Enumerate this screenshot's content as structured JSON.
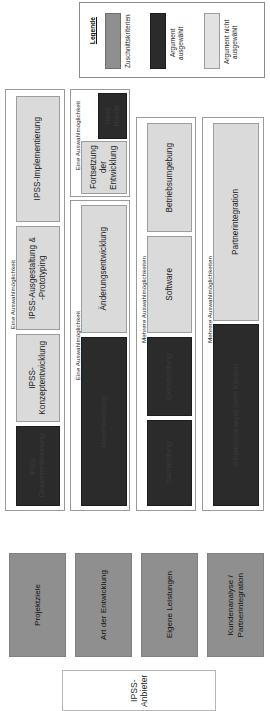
{
  "diagram": {
    "root": {
      "label": "IPSS- Anbieter"
    },
    "legend": {
      "title": "Legende",
      "items": [
        {
          "label": "Zuschnittskriterien",
          "color": "#8f8f8f",
          "swatch": "criterion"
        },
        {
          "label": "Argument\nausgewählt",
          "color": "#2b2b2b",
          "swatch": "selected"
        },
        {
          "label": "Argument nicht\nausgewählt",
          "color": "#dadada",
          "swatch": "unselected"
        }
      ]
    },
    "columns": [
      {
        "criterion": "Projektziele",
        "group_label": "Eine Auswahlmöglichkeit",
        "nodes": [
          {
            "label": "IPSS-Implementierung",
            "state": "unselected"
          },
          {
            "label": "IPSS-Ausgestaltung &\n-Prototyping",
            "state": "unselected"
          },
          {
            "label": "IPSS-\nKonzeptentwicklung",
            "state": "unselected"
          },
          {
            "label": "IPSS-\nGesamtentwicklung",
            "state": "selected"
          }
        ]
      },
      {
        "criterion": "Art der Entwicklung",
        "group_label": "Eine Auswahlmöglichkeit",
        "subgroup_label": "Eine Auswahlmöglichkeit",
        "nodes": [
          {
            "label": "Neue\nRunde",
            "state": "selected"
          },
          {
            "label": "Fortsetzung der\nEntwicklung",
            "state": "unselected"
          },
          {
            "label": "Änderungsentwicklung",
            "state": "unselected"
          },
          {
            "label": "Neuentwicklung",
            "state": "selected"
          }
        ]
      },
      {
        "criterion": "Eigene Leistungen",
        "group_label": "Mehrere Auswahlmöglichkeiten",
        "nodes": [
          {
            "label": "Betriebsumgebung",
            "state": "unselected"
          },
          {
            "label": "Software",
            "state": "unselected"
          },
          {
            "label": "Dienstleistung",
            "state": "selected"
          },
          {
            "label": "Sachleistung",
            "state": "selected"
          }
        ]
      },
      {
        "criterion": "Kundenanalyse /\nPartnerintegration",
        "group_label": "Mehrere Auswahlmöglichkeiten",
        "nodes": [
          {
            "label": "Partnerintegration",
            "state": "unselected"
          },
          {
            "label": "Situationsanalyse beim Kunden",
            "state": "selected"
          }
        ]
      }
    ]
  }
}
